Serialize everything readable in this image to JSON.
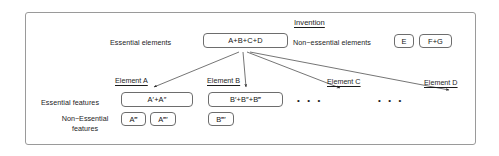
{
  "diagram": {
    "title": "Invention",
    "top_row": {
      "essential_label": "Essential elements",
      "essential_box": "A+B+C+D",
      "non_essential_label": "Non−essential elements",
      "non_essential_boxes": [
        "E",
        "F+G"
      ]
    },
    "row_labels": {
      "essential_features": "Essential features",
      "non_essential_features_line1": "Non−Essential",
      "non_essential_features_line2": "features"
    },
    "columns": [
      {
        "header": "Element A",
        "essential_features": "A′+A″",
        "non_essential_features": [
          "A‴",
          "A‴′"
        ]
      },
      {
        "header": "Element B",
        "essential_features": "B′+B″+B‴",
        "non_essential_features": [
          "B‴′"
        ]
      },
      {
        "header": "Element C",
        "essential_features": "• • •",
        "non_essential_features": []
      },
      {
        "header": "Element D",
        "essential_features": "• • •",
        "non_essential_features": []
      }
    ],
    "colors": {
      "frame_border": "#9a9a9a",
      "box_border": "#6d6d6d",
      "text": "#1c1c1c",
      "arrow": "#2a2a2a",
      "background": "#ffffff"
    }
  }
}
